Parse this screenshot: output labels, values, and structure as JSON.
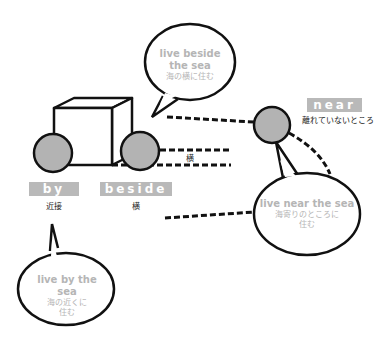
{
  "labels": {
    "by": {
      "word": "by",
      "meaning": "近接"
    },
    "beside": {
      "word": "beside",
      "meaning": "横"
    },
    "near": {
      "word": "near",
      "meaning": "離れていないところ"
    },
    "beside_line": "横"
  },
  "bubbles": {
    "beside": {
      "en1": "live beside",
      "en2": "the sea",
      "ja": "海の横に住む"
    },
    "near": {
      "en": "live near the sea",
      "ja1": "海寄りのところに",
      "ja2": "住む"
    },
    "by": {
      "en": "live by the sea",
      "ja1": "海の近くに",
      "ja2": "住む"
    }
  },
  "colors": {
    "label_bg": "#b9b9b9",
    "circle_fill": "#b3b3b3",
    "bubble_text": "#b5b5b5"
  }
}
